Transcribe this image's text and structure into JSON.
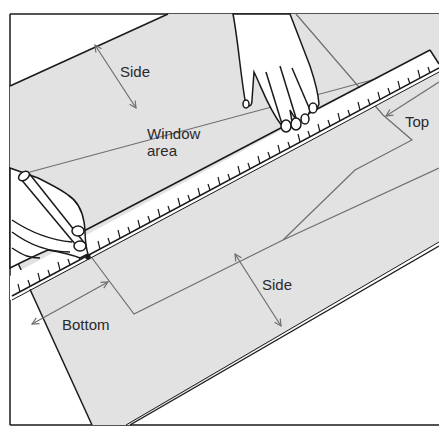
{
  "diagram": {
    "labels": {
      "side_top": "Side",
      "window_area_line1": "Window",
      "window_area_line2": "area",
      "top": "Top",
      "side_bottom": "Side",
      "bottom": "Bottom"
    },
    "colors": {
      "fabric": "#e2e2e2",
      "outline": "#1a1a1a",
      "guide": "#6e6e6e",
      "ruler": "#ffffff",
      "background": "#ffffff"
    },
    "elements": [
      "fabric-panel",
      "ruler",
      "left-hand-with-pencil",
      "right-hand",
      "window-area-outline",
      "dimension-arrows"
    ]
  }
}
